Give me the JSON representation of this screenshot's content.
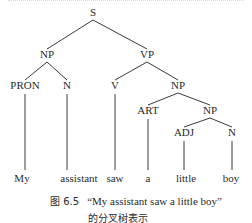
{
  "tree": {
    "nodes": [
      {
        "id": "S",
        "label": "S",
        "x": 93,
        "y": 16
      },
      {
        "id": "NP1",
        "label": "NP",
        "x": 47,
        "y": 58
      },
      {
        "id": "VP",
        "label": "VP",
        "x": 147,
        "y": 58
      },
      {
        "id": "PRON",
        "label": "PRON",
        "x": 25,
        "y": 89
      },
      {
        "id": "N1",
        "label": "N",
        "x": 67,
        "y": 89
      },
      {
        "id": "V",
        "label": "V",
        "x": 115,
        "y": 89
      },
      {
        "id": "NP2",
        "label": "NP",
        "x": 178,
        "y": 89
      },
      {
        "id": "ART",
        "label": "ART",
        "x": 148,
        "y": 114
      },
      {
        "id": "NP3",
        "label": "NP",
        "x": 210,
        "y": 114
      },
      {
        "id": "ADJ",
        "label": "ADJ",
        "x": 184,
        "y": 136
      },
      {
        "id": "N2",
        "label": "N",
        "x": 232,
        "y": 136
      }
    ],
    "leaves": [
      {
        "id": "w1",
        "label": "My",
        "x": 22,
        "y": 182,
        "parent": "PRON"
      },
      {
        "id": "w2",
        "label": "assistant",
        "x": 79,
        "y": 182,
        "parent": "N1"
      },
      {
        "id": "w3",
        "label": "saw",
        "x": 115,
        "y": 182,
        "parent": "V"
      },
      {
        "id": "w4",
        "label": "a",
        "x": 148,
        "y": 182,
        "parent": "ART"
      },
      {
        "id": "w5",
        "label": "little",
        "x": 186,
        "y": 182,
        "parent": "ADJ"
      },
      {
        "id": "w6",
        "label": "boy",
        "x": 231,
        "y": 182,
        "parent": "N2"
      }
    ],
    "edges": [
      [
        "S",
        "NP1"
      ],
      [
        "S",
        "VP"
      ],
      [
        "NP1",
        "PRON"
      ],
      [
        "NP1",
        "N1"
      ],
      [
        "VP",
        "V"
      ],
      [
        "VP",
        "NP2"
      ],
      [
        "NP2",
        "ART"
      ],
      [
        "NP2",
        "NP3"
      ],
      [
        "NP3",
        "ADJ"
      ],
      [
        "NP3",
        "N2"
      ]
    ]
  },
  "caption": {
    "figure_label": "图 6.5",
    "line1": "“My assistant saw a little boy”",
    "line2": "的分叉树表示"
  }
}
